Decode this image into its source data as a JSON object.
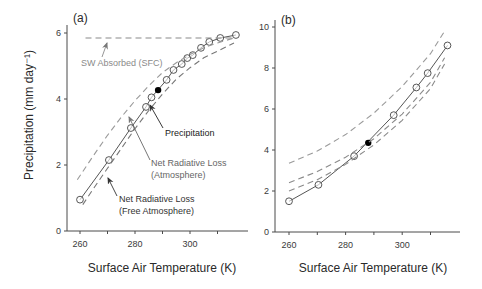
{
  "chart_data": [
    {
      "panel": "(a)",
      "type": "line",
      "xlabel": "Surface Air Temperature (K)",
      "ylabel": "Precipitation (mm day⁻¹)",
      "xlim": [
        255,
        319
      ],
      "ylim": [
        0,
        6.2
      ],
      "xticks": [
        260,
        270,
        280,
        290,
        300,
        310
      ],
      "xtick_labels": [
        "260",
        "",
        "280",
        "",
        "300",
        ""
      ],
      "yticks": [
        0,
        2,
        4,
        6
      ],
      "ytick_labels": [
        "0",
        "2",
        "4",
        "6"
      ],
      "grid": false,
      "series": [
        {
          "name": "Precipitation",
          "style": "solid-open-circles",
          "color": "#555555",
          "x": [
            260,
            270.5,
            278.5,
            284,
            286,
            291.5,
            294,
            297,
            299,
            301,
            304,
            307,
            311,
            316.7
          ],
          "y": [
            0.95,
            2.15,
            3.12,
            3.76,
            4.05,
            4.58,
            4.88,
            5.06,
            5.24,
            5.33,
            5.55,
            5.73,
            5.85,
            5.94
          ]
        },
        {
          "name": "Control (filled)",
          "style": "filled-circle",
          "color": "#000000",
          "x": [
            288.4
          ],
          "y": [
            4.27
          ]
        },
        {
          "name": "SW Absorbed (SFC)",
          "style": "dashed",
          "color": "#8a8a8a",
          "x": [
            262,
            316
          ],
          "y": [
            5.85,
            5.85
          ]
        },
        {
          "name": "Net Radiative Loss (Atmosphere)",
          "style": "dashed",
          "color": "#9a9a9a",
          "x": [
            259,
            265,
            270,
            275,
            280,
            285,
            290,
            295,
            300,
            305,
            310,
            316
          ],
          "y": [
            1.55,
            2.3,
            2.9,
            3.45,
            3.95,
            4.4,
            4.8,
            5.1,
            5.35,
            5.55,
            5.7,
            5.85
          ]
        },
        {
          "name": "Net Radiative Loss (Free Atmosphere)",
          "style": "dashed",
          "color": "#777777",
          "x": [
            261,
            265,
            270,
            275,
            280,
            285,
            290,
            295,
            300,
            305,
            310,
            316
          ],
          "y": [
            0.8,
            1.3,
            1.9,
            2.5,
            3.1,
            3.65,
            4.15,
            4.6,
            4.95,
            5.25,
            5.45,
            5.7
          ]
        }
      ],
      "annotations": [
        {
          "text": [
            "SW Absorbed (SFC)"
          ],
          "color": "#8a8a8a",
          "tx": 81,
          "ty": 66,
          "arrow_from": [
            102,
            57
          ],
          "arrow_to": [
            107,
            43
          ]
        },
        {
          "text": [
            "Precipitation"
          ],
          "color": "#222222",
          "tx": 165,
          "ty": 136,
          "arrow_from": [
            163,
            128
          ],
          "arrow_to": [
            150,
            105
          ]
        },
        {
          "text": [
            "Net Radiative Loss",
            "(Atmosphere)"
          ],
          "color": "#666666",
          "tx": 151,
          "ty": 166,
          "arrow_from": [
            150,
            160
          ],
          "arrow_to": [
            129,
            117
          ]
        },
        {
          "text": [
            "Net Radiative Loss",
            "(Free Atmosphere)"
          ],
          "color": "#333333",
          "tx": 119,
          "ty": 202,
          "arrow_from": [
            117,
            196
          ],
          "arrow_to": [
            108,
            178
          ]
        }
      ]
    },
    {
      "panel": "(b)",
      "type": "line",
      "xlabel": "Surface Air Temperature (K)",
      "ylabel": "",
      "xlim": [
        255,
        319
      ],
      "ylim": [
        0,
        10.3
      ],
      "xticks": [
        260,
        270,
        280,
        290,
        300,
        310
      ],
      "xtick_labels": [
        "260",
        "",
        "280",
        "",
        "300",
        ""
      ],
      "yticks": [
        0,
        2,
        4,
        6,
        8,
        10
      ],
      "ytick_labels": [
        "0",
        "2",
        "4",
        "6",
        "8",
        "10"
      ],
      "grid": false,
      "series": [
        {
          "name": "Precipitation",
          "style": "solid-open-circles",
          "color": "#555555",
          "x": [
            260,
            270.4,
            283,
            297,
            305,
            309,
            316
          ],
          "y": [
            1.5,
            2.3,
            3.7,
            5.7,
            7.05,
            7.75,
            9.1
          ]
        },
        {
          "name": "Control (filled)",
          "style": "filled-circle",
          "color": "#000000",
          "x": [
            288
          ],
          "y": [
            4.35
          ]
        },
        {
          "name": "Upper dashed",
          "style": "dashed",
          "color": "#9a9a9a",
          "x": [
            260,
            270,
            280,
            290,
            300,
            310,
            315
          ],
          "y": [
            3.35,
            3.95,
            4.75,
            5.8,
            7.1,
            8.7,
            9.8
          ]
        },
        {
          "name": "Middle dashed",
          "style": "dashed",
          "color": "#8a8a8a",
          "x": [
            260,
            270,
            280,
            290,
            300,
            310,
            315
          ],
          "y": [
            2.4,
            2.95,
            3.65,
            4.55,
            5.75,
            7.3,
            8.5
          ]
        },
        {
          "name": "Lower dashed",
          "style": "dashed",
          "color": "#8a8a8a",
          "x": [
            260,
            270,
            280,
            290,
            300,
            310,
            315
          ],
          "y": [
            2.0,
            2.55,
            3.3,
            4.25,
            5.45,
            7.0,
            8.2
          ]
        }
      ],
      "annotations": []
    }
  ],
  "layout": {
    "panels": [
      {
        "x0": 67,
        "x1": 248,
        "y0": 231,
        "y1": 25,
        "px_per_k": 2.75,
        "k0": 260,
        "kx0": 80,
        "px_per_unit": 33.0
      },
      {
        "x0": 275,
        "x1": 460,
        "y0": 232,
        "y1": 20,
        "px_per_k": 2.83,
        "k0": 260,
        "kx0": 289,
        "px_per_unit": 20.5
      }
    ]
  }
}
